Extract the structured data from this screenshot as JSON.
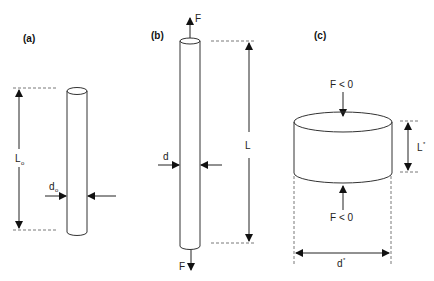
{
  "panels": {
    "a": {
      "label": "(a)",
      "length_label": "L",
      "length_sub": "o",
      "diameter_label": "d",
      "diameter_sub": "o"
    },
    "b": {
      "label": "(b)",
      "force_top": "F",
      "force_bottom": "F",
      "length_label": "L",
      "diameter_label": "d"
    },
    "c": {
      "label": "(c)",
      "force_top": "F < 0",
      "force_bottom": "F < 0",
      "length_label": "L",
      "length_sup": "*",
      "diameter_label": "d",
      "diameter_sup": "*"
    }
  },
  "colors": {
    "stroke": "#333333",
    "dash": "#555555",
    "background": "#ffffff"
  }
}
